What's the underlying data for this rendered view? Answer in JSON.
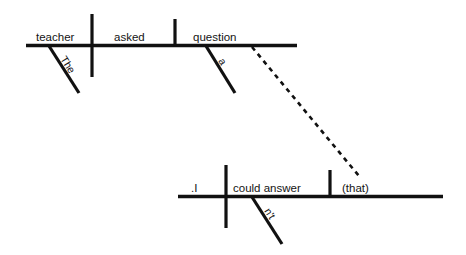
{
  "diagram": {
    "sentence": "The teacher asked a question (that) I couldn't answer.",
    "background_color": "#ffffff",
    "line_color": "#111111",
    "clauses": [
      {
        "name": "main-clause",
        "subject": "teacher",
        "verb": "asked",
        "object": "question",
        "modifiers": [
          {
            "word": "The",
            "attaches_to": "teacher"
          },
          {
            "word": "a",
            "attaches_to": "question"
          }
        ]
      },
      {
        "name": "relative-clause",
        "subject": ".I",
        "verb": "could answer",
        "object": "(that)",
        "modifiers": [
          {
            "word": "n't",
            "attaches_to": "could answer"
          }
        ]
      }
    ],
    "connector": {
      "name": "relative-pronoun-connector",
      "style": "dashed",
      "from": "question",
      "to": "(that)"
    },
    "labels": {
      "subject_main": "teacher",
      "verb_main": "asked",
      "object_main": "question",
      "modifier_the": "The",
      "modifier_a": "a",
      "subject_sub": ".I",
      "verb_sub": "could answer",
      "object_sub": "(that)",
      "modifier_nt": "n't"
    }
  }
}
